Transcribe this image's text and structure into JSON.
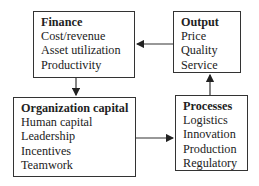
{
  "boxes": {
    "finance": {
      "title": "Finance",
      "items": [
        "Cost/revenue",
        "Asset utilization",
        "Productivity"
      ]
    },
    "output": {
      "title": "Output",
      "items": [
        "Price",
        "Quality",
        "Service"
      ]
    },
    "organization_capital": {
      "title": "Organization capital",
      "items": [
        "Human capital",
        "Leadership",
        "Incentives",
        "Teamwork"
      ]
    },
    "processes": {
      "title": "Processes",
      "items": [
        "Logistics",
        "Innovation",
        "Production",
        "Regulatory"
      ]
    }
  },
  "edges": [
    {
      "from": "Output",
      "to": "Finance"
    },
    {
      "from": "Finance",
      "to": "Organization capital"
    },
    {
      "from": "Organization capital",
      "to": "Processes"
    },
    {
      "from": "Processes",
      "to": "Output"
    }
  ]
}
